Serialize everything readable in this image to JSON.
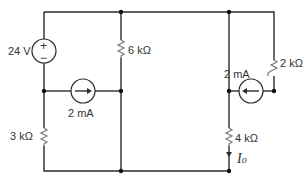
{
  "diagram": {
    "type": "circuit",
    "components": {
      "voltage_source": {
        "label": "24 V",
        "plus": "+",
        "minus": "−"
      },
      "current_source_left": {
        "label": "2 mA",
        "direction": "right"
      },
      "current_source_right": {
        "label": "2 mA",
        "direction": "left"
      },
      "resistor_6k": {
        "label": "6 kΩ"
      },
      "resistor_3k": {
        "label": "3 kΩ"
      },
      "resistor_2k": {
        "label": "2 kΩ"
      },
      "resistor_4k": {
        "label": "4 kΩ"
      },
      "current_label": {
        "main": "I",
        "sub": "o"
      }
    }
  }
}
